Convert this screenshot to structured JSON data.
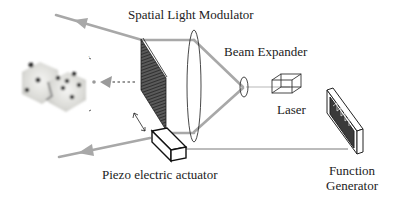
{
  "diagram": {
    "labels": {
      "slm": "Spatial Light Modulator",
      "beam_expander": "Beam Expander",
      "laser": "Laser",
      "piezo": "Piezo electric actuator",
      "function_generator_line1": "Function",
      "function_generator_line2": "Generator"
    },
    "components": [
      {
        "id": "slm",
        "name": "Spatial Light Modulator",
        "shape": "tilted textured plate"
      },
      {
        "id": "large-lens",
        "name": "Collimating lens",
        "shape": "vertical ellipse"
      },
      {
        "id": "small-lens",
        "name": "Beam Expander lens",
        "shape": "small ellipse"
      },
      {
        "id": "laser",
        "name": "Laser",
        "shape": "wireframe box"
      },
      {
        "id": "function-generator",
        "name": "Function Generator",
        "shape": "box with square wave display"
      },
      {
        "id": "piezo",
        "name": "Piezo electric actuator",
        "shape": "solid box"
      },
      {
        "id": "dice",
        "name": "Reconstructed 3D image (dice)",
        "shape": "image"
      }
    ],
    "colors": {
      "beam": "#a8a8a8",
      "line": "#222222",
      "wire": "#555555",
      "slm_fill": "#3a3a3a"
    }
  }
}
